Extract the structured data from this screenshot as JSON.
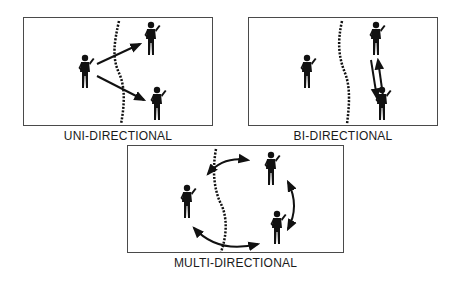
{
  "panels": [
    {
      "id": "uni",
      "label": "UNI-DIRECTIONAL",
      "description": "One sender sends signals across a lane boundary to two receivers; arrows point one way only"
    },
    {
      "id": "bi",
      "label": "BI-DIRECTIONAL",
      "description": "Two figures exchange signals with double arrows going both ways"
    },
    {
      "id": "multi",
      "label": "MULTI-DIRECTIONAL",
      "description": "Three figures arranged around a circle with arrows between each pair"
    }
  ],
  "colors": {
    "ink": "#111111",
    "border": "#4a4a4a",
    "background": "#ffffff"
  }
}
